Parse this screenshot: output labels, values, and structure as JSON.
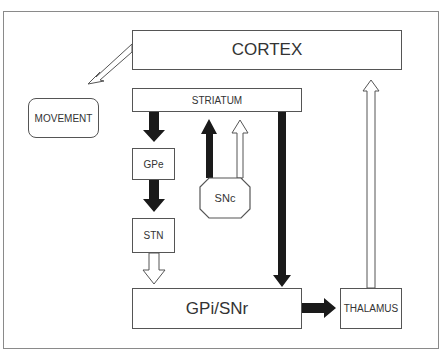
{
  "diagram": {
    "nodes": {
      "cortex": {
        "label": "CORTEX"
      },
      "striatum": {
        "label": "STRIATUM"
      },
      "movement": {
        "label": "MOVEMENT"
      },
      "gpe": {
        "label": "GPe"
      },
      "snc": {
        "label": "SNc"
      },
      "stn": {
        "label": "STN"
      },
      "gpi_snr": {
        "label": "GPi/SNr"
      },
      "thalamus": {
        "label": "THALAMUS"
      }
    },
    "edges": [
      {
        "from": "CORTEX",
        "to": "MOVEMENT",
        "style": "open"
      },
      {
        "from": "STRIATUM",
        "to": "GPe",
        "style": "filled"
      },
      {
        "from": "GPe",
        "to": "STN",
        "style": "filled"
      },
      {
        "from": "STN",
        "to": "GPi/SNr",
        "style": "open"
      },
      {
        "from": "SNc",
        "to": "STRIATUM",
        "style": "filled"
      },
      {
        "from": "SNc",
        "to": "STRIATUM",
        "style": "open"
      },
      {
        "from": "STRIATUM",
        "to": "GPi/SNr",
        "style": "filled"
      },
      {
        "from": "GPi/SNr",
        "to": "THALAMUS",
        "style": "filled"
      },
      {
        "from": "THALAMUS",
        "to": "CORTEX",
        "style": "open"
      }
    ],
    "colors": {
      "border": "#555555",
      "filled_arrow": "#1a1a1a",
      "frame": "#8a8a8a"
    }
  }
}
